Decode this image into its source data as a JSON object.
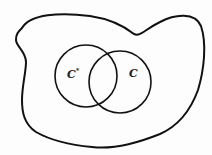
{
  "diagram": {
    "labels": {
      "left_circle": "C",
      "left_circle_superscript": "*",
      "right_circle": "C"
    },
    "colors": {
      "stroke": "#111111",
      "background": "#fdfdfd"
    }
  }
}
